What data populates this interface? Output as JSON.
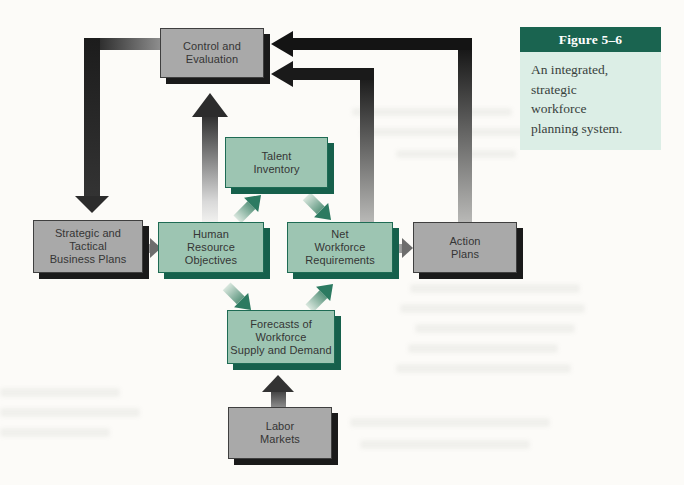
{
  "figure_caption": {
    "title": "Figure 5–6",
    "description": "An integrated,\nstrategic\nworkforce\nplanning system.",
    "header_bg": "#1a6450",
    "body_bg": "#dceee6"
  },
  "boxes": {
    "control_evaluation": {
      "label": "Control and\nEvaluation",
      "type": "gray"
    },
    "strategic_plans": {
      "label": "Strategic and\nTactical\nBusiness Plans",
      "type": "gray"
    },
    "human_resource_objectives": {
      "label": "Human\nResource\nObjectives",
      "type": "teal"
    },
    "talent_inventory": {
      "label": "Talent\nInventory",
      "type": "teal"
    },
    "net_workforce_requirements": {
      "label": "Net\nWorkforce\nRequirements",
      "type": "teal"
    },
    "action_plans": {
      "label": "Action\nPlans",
      "type": "gray"
    },
    "forecasts": {
      "label": "Forecasts of\nWorkforce\nSupply and Demand",
      "type": "teal"
    },
    "labor_markets": {
      "label": "Labor\nMarkets",
      "type": "gray"
    }
  },
  "colors": {
    "gray_box_fill": "#a9a9a9",
    "gray_box_shadow": "#1a1a1a",
    "teal_box_fill": "#9dc5b2",
    "teal_box_border": "#1e6b54",
    "teal_box_shadow": "#16604c",
    "arrow_dark": "#1a1a1a",
    "arrow_teal_head": "#2c7a61",
    "caption_header_bg": "#1a6450",
    "caption_body_bg": "#dceee6",
    "page_bg": "#fcfbf8"
  }
}
